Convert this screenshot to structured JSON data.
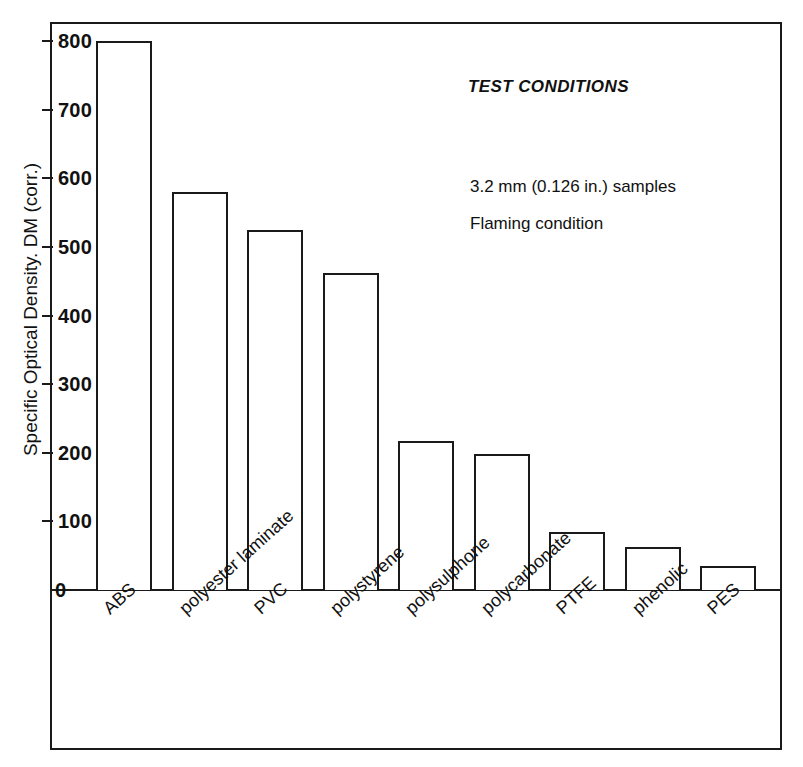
{
  "chart_data": {
    "type": "bar",
    "title": "",
    "xlabel": "",
    "ylabel": "Specific Optical Density. DM (corr.)",
    "ylim": [
      0,
      800
    ],
    "yticks": [
      0,
      100,
      200,
      300,
      400,
      500,
      600,
      700,
      800
    ],
    "ytick_labels": [
      "0",
      "100",
      "200",
      "300",
      "400",
      "500",
      "600",
      "700",
      "800"
    ],
    "grid": false,
    "legend": null,
    "categories": [
      "ABS",
      "polyester laminate",
      "PVC",
      "polystyrene",
      "polysulphone",
      "polycarbonate",
      "PTFE",
      "phenolic",
      "PES"
    ],
    "values": [
      800,
      580,
      525,
      462,
      217,
      198,
      85,
      63,
      35
    ],
    "bar_style": {
      "fill": "#ffffff",
      "edge": "#1a1a1a"
    },
    "annotations": [
      {
        "text": "TEST CONDITIONS",
        "style": "italic"
      },
      {
        "text": "3.2 mm (0.126 in.) samples",
        "style": "normal"
      },
      {
        "text": "Flaming condition",
        "style": "normal"
      }
    ]
  },
  "annotation_block": {
    "heading": "TEST CONDITIONS",
    "line1": "3.2 mm (0.126 in.) samples",
    "line2": "Flaming condition"
  },
  "colors": {
    "ink": "#1a1a1a",
    "background": "#ffffff"
  }
}
